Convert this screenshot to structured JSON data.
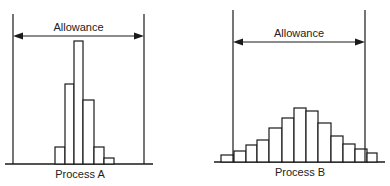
{
  "panels": [
    {
      "id": "A",
      "caption": "Process A",
      "allowance_label": "Allowance",
      "limit_left_x": 13,
      "limit_right_x": 144,
      "limit_top_y": 14,
      "arrow_y": 36,
      "baseline_y": 164,
      "axis_x_start": 5,
      "axis_x_end": 153,
      "bars": [
        {
          "x0": 55,
          "x1": 65,
          "top": 147
        },
        {
          "x0": 65,
          "x1": 74,
          "top": 84
        },
        {
          "x0": 74,
          "x1": 83,
          "top": 41
        },
        {
          "x0": 83,
          "x1": 94,
          "top": 100
        },
        {
          "x0": 94,
          "x1": 104,
          "top": 147
        },
        {
          "x0": 104,
          "x1": 114,
          "top": 158
        }
      ]
    },
    {
      "id": "B",
      "caption": "Process B",
      "allowance_label": "Allowance",
      "limit_left_x": 233,
      "limit_right_x": 365,
      "limit_top_y": 10,
      "arrow_y": 42,
      "baseline_y": 162,
      "axis_x_start": 214,
      "axis_x_end": 385,
      "bars": [
        {
          "x0": 221,
          "x1": 234,
          "top": 155
        },
        {
          "x0": 234,
          "x1": 246,
          "top": 151
        },
        {
          "x0": 246,
          "x1": 257,
          "top": 145
        },
        {
          "x0": 257,
          "x1": 269,
          "top": 140
        },
        {
          "x0": 269,
          "x1": 282,
          "top": 128
        },
        {
          "x0": 282,
          "x1": 294,
          "top": 118
        },
        {
          "x0": 294,
          "x1": 306,
          "top": 108
        },
        {
          "x0": 306,
          "x1": 318,
          "top": 111
        },
        {
          "x0": 318,
          "x1": 331,
          "top": 123
        },
        {
          "x0": 331,
          "x1": 343,
          "top": 136
        },
        {
          "x0": 343,
          "x1": 355,
          "top": 144
        },
        {
          "x0": 355,
          "x1": 367,
          "top": 149
        },
        {
          "x0": 367,
          "x1": 377,
          "top": 153
        }
      ]
    }
  ],
  "colors": {
    "stroke": "#1a1a1a",
    "fill": "#ffffff"
  }
}
